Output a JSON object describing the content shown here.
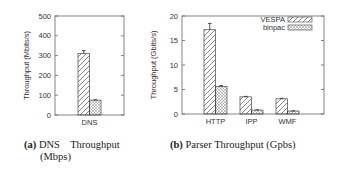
{
  "chart_data": [
    {
      "type": "bar",
      "title": "",
      "caption_label": "(a)",
      "caption": "DNS Throughput (Mbps)",
      "caption_line1": "DNS    Throughput",
      "caption_line2": "(Mbps)",
      "xlabel": "",
      "ylabel": "Throughput (Mbits/s)",
      "ylim": [
        0,
        500
      ],
      "yticks": [
        0,
        100,
        200,
        300,
        400,
        500
      ],
      "categories": [
        "DNS"
      ],
      "series": [
        {
          "name": "VESPA",
          "values": [
            310
          ],
          "error": [
            15
          ],
          "pattern": "diagonal-hatch"
        },
        {
          "name": "binpac",
          "values": [
            75
          ],
          "error": [
            2
          ],
          "pattern": "cross-hatch"
        }
      ],
      "legend": "none",
      "grid": false
    },
    {
      "type": "bar",
      "title": "",
      "caption_label": "(b)",
      "caption": "Parser Throughput (Gpbs)",
      "xlabel": "",
      "ylabel": "Throughput (Gbits/s)",
      "ylim": [
        0,
        20
      ],
      "yticks": [
        0,
        5,
        10,
        15,
        20
      ],
      "categories": [
        "HTTP",
        "IPP",
        "WMF"
      ],
      "series": [
        {
          "name": "VESPA",
          "values": [
            17.2,
            3.5,
            3.1
          ],
          "error": [
            1.3,
            0.1,
            0.1
          ],
          "pattern": "diagonal-hatch"
        },
        {
          "name": "binpac",
          "values": [
            5.6,
            0.8,
            0.6
          ],
          "error": [
            0.2,
            0.05,
            0.05
          ],
          "pattern": "cross-hatch"
        }
      ],
      "legend": "top-right",
      "grid": false
    }
  ]
}
